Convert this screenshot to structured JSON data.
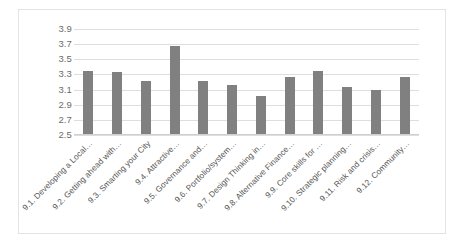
{
  "chart_data": {
    "type": "bar",
    "title": "",
    "subtitle": "",
    "xlabel": "",
    "ylabel": "",
    "ylim": [
      2.5,
      3.9
    ],
    "ytick_step": 0.2,
    "yticks": [
      "3.9",
      "3.7",
      "3.5",
      "3.3",
      "3.1",
      "2.9",
      "2.7",
      "2.5"
    ],
    "ytick_values": [
      3.9,
      3.7,
      3.5,
      3.3,
      3.1,
      2.9,
      2.7,
      2.5
    ],
    "grid": true,
    "legend": false,
    "legend_position": "none",
    "bar_color": "#808080",
    "gridline_color": "#dedede",
    "categories": [
      "9.1. Developing a Local…",
      "9.2. Getting ahead with…",
      "9.3. Smarting your City",
      "9.4. Attractive…",
      "9.5. Governance and…",
      "9.6. Portfolio/system…",
      "9.7. Design Thinking in…",
      "9.8. Alternative Finance…",
      "9.9. Core skills for …",
      "9.10. Strategic planning…",
      "9.11. Risk and crisis…",
      "9.12. Community…"
    ],
    "values": [
      3.35,
      3.33,
      3.21,
      3.67,
      3.22,
      3.16,
      3.02,
      3.27,
      3.35,
      3.14,
      3.1,
      3.27
    ]
  }
}
